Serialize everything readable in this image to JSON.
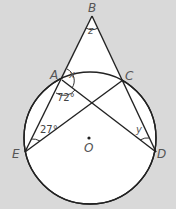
{
  "diagram": {
    "points": {
      "A": {
        "label": "A",
        "x": 62,
        "y": 80
      },
      "B": {
        "label": "B",
        "x": 92,
        "y": 16
      },
      "C": {
        "label": "C",
        "x": 123,
        "y": 80
      },
      "D": {
        "label": "D",
        "x": 156,
        "y": 152
      },
      "E": {
        "label": "E",
        "x": 25,
        "y": 152
      },
      "O": {
        "label": "O",
        "x": 89,
        "y": 137
      }
    },
    "circle": {
      "cx": 90,
      "cy": 138,
      "r": 66,
      "center_label": "O"
    },
    "angles": {
      "at_B": "z",
      "at_A_upper": "x",
      "at_A_lower": "72°",
      "at_E": "27°",
      "at_D": "y"
    },
    "colors": {
      "background": "#d9d9d9",
      "fill": "#ffffff",
      "stroke": "#222222"
    }
  }
}
